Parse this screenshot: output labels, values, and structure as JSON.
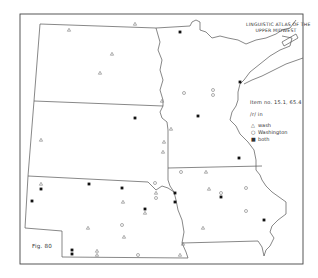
{
  "map": {
    "title_line1": "LINGUISTIC ATLAS OF THE",
    "title_line2": "UPPER MIDWEST",
    "item_label": "Item no. 15.1, 65.4",
    "phoneme_label": "/r/ in",
    "figure_label": "Fig. 80",
    "legend": [
      {
        "symbol": "triangle",
        "glyph": "△",
        "label": "wash"
      },
      {
        "symbol": "circle",
        "glyph": "○",
        "label": "Washington"
      },
      {
        "symbol": "square",
        "glyph": "■",
        "label": "both"
      }
    ],
    "colors": {
      "border": "#444444",
      "state_lines": "#555555",
      "marker_open": "#777777",
      "marker_filled": "#111111"
    },
    "states": [
      "North Dakota",
      "Minnesota",
      "South Dakota",
      "Nebraska",
      "Iowa"
    ],
    "markers": [
      {
        "type": "triangle",
        "x": 69,
        "y": 30
      },
      {
        "type": "triangle",
        "x": 135,
        "y": 24
      },
      {
        "type": "triangle",
        "x": 112,
        "y": 54
      },
      {
        "type": "triangle",
        "x": 100,
        "y": 73
      },
      {
        "type": "square",
        "x": 180,
        "y": 32
      },
      {
        "type": "circle",
        "x": 184,
        "y": 93
      },
      {
        "type": "circle",
        "x": 213,
        "y": 90
      },
      {
        "type": "circle",
        "x": 213,
        "y": 95
      },
      {
        "type": "square",
        "x": 240,
        "y": 82
      },
      {
        "type": "square",
        "x": 198,
        "y": 116
      },
      {
        "type": "triangle",
        "x": 162,
        "y": 101
      },
      {
        "type": "triangle",
        "x": 41,
        "y": 140
      },
      {
        "type": "square",
        "x": 135,
        "y": 118
      },
      {
        "type": "triangle",
        "x": 164,
        "y": 142
      },
      {
        "type": "triangle",
        "x": 163,
        "y": 152
      },
      {
        "type": "triangle",
        "x": 171,
        "y": 129
      },
      {
        "type": "square",
        "x": 239,
        "y": 158
      },
      {
        "type": "circle",
        "x": 181,
        "y": 172
      },
      {
        "type": "triangle",
        "x": 206,
        "y": 172
      },
      {
        "type": "triangle",
        "x": 41,
        "y": 184
      },
      {
        "type": "square",
        "x": 41,
        "y": 189
      },
      {
        "type": "square",
        "x": 89,
        "y": 184
      },
      {
        "type": "square",
        "x": 122,
        "y": 188
      },
      {
        "type": "square",
        "x": 32,
        "y": 201
      },
      {
        "type": "triangle",
        "x": 123,
        "y": 202
      },
      {
        "type": "square",
        "x": 145,
        "y": 209
      },
      {
        "type": "triangle",
        "x": 145,
        "y": 213
      },
      {
        "type": "circle",
        "x": 155,
        "y": 183
      },
      {
        "type": "triangle",
        "x": 156,
        "y": 193
      },
      {
        "type": "circle",
        "x": 156,
        "y": 198
      },
      {
        "type": "square",
        "x": 175,
        "y": 193
      },
      {
        "type": "square",
        "x": 175,
        "y": 202
      },
      {
        "type": "triangle",
        "x": 209,
        "y": 189
      },
      {
        "type": "circle",
        "x": 221,
        "y": 193
      },
      {
        "type": "square",
        "x": 221,
        "y": 197
      },
      {
        "type": "circle",
        "x": 246,
        "y": 188
      },
      {
        "type": "circle",
        "x": 246,
        "y": 211
      },
      {
        "type": "square",
        "x": 264,
        "y": 220
      },
      {
        "type": "triangle",
        "x": 203,
        "y": 228
      },
      {
        "type": "circle",
        "x": 122,
        "y": 225
      },
      {
        "type": "triangle",
        "x": 124,
        "y": 237
      },
      {
        "type": "triangle",
        "x": 88,
        "y": 228
      },
      {
        "type": "square",
        "x": 72,
        "y": 250
      },
      {
        "type": "square",
        "x": 72,
        "y": 254
      },
      {
        "type": "triangle",
        "x": 97,
        "y": 251
      },
      {
        "type": "triangle",
        "x": 97,
        "y": 255
      },
      {
        "type": "circle",
        "x": 138,
        "y": 255
      },
      {
        "type": "triangle",
        "x": 180,
        "y": 255
      },
      {
        "type": "triangle",
        "x": 183,
        "y": 244
      }
    ]
  }
}
